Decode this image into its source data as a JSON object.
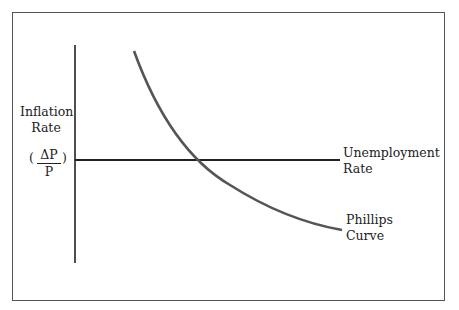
{
  "diagram": {
    "title": "Phillips Curve",
    "y_axis_label_line1": "Inflation",
    "y_axis_label_line2": "Rate",
    "y_axis_formula_numerator": "ΔP",
    "y_axis_formula_denominator": "P",
    "y_axis_formula_open": "(",
    "y_axis_formula_close": ")",
    "x_axis_label_line1": "Unemployment",
    "x_axis_label_line2": "Rate",
    "curve_label_line1": "Phillips",
    "curve_label_line2": "Curve",
    "colors": {
      "curve": "#555555",
      "axes": "#222222",
      "frame": "#555555"
    }
  }
}
